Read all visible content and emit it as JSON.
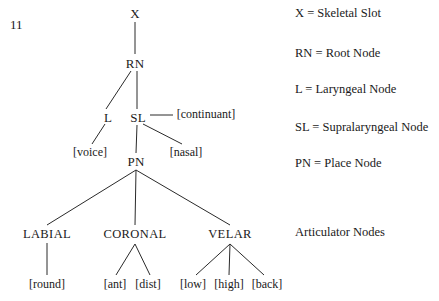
{
  "figure": {
    "number": "11",
    "title_hidden": "",
    "background_color": "#ffffff",
    "line_color": "#2a2a2a",
    "text_color": "#1a1a1a"
  },
  "tree": {
    "nodes": [
      {
        "id": "x",
        "label": "X",
        "x": 135,
        "y": 13
      },
      {
        "id": "rn",
        "label": "RN",
        "x": 135,
        "y": 63
      },
      {
        "id": "l",
        "label": "L",
        "x": 108,
        "y": 117
      },
      {
        "id": "sl",
        "label": "SL",
        "x": 138,
        "y": 117
      },
      {
        "id": "pn",
        "label": "PN",
        "x": 136,
        "y": 161
      },
      {
        "id": "labial",
        "label": "LABIAL",
        "x": 47,
        "y": 234
      },
      {
        "id": "coronal",
        "label": "CORONAL",
        "x": 135,
        "y": 234
      },
      {
        "id": "velar",
        "label": "VELAR",
        "x": 230,
        "y": 234
      }
    ],
    "features": [
      {
        "id": "continuant",
        "label": "[continuant]",
        "x": 206,
        "y": 114
      },
      {
        "id": "voice",
        "label": "[voice]",
        "x": 90,
        "y": 152
      },
      {
        "id": "nasal",
        "label": "[nasal]",
        "x": 186,
        "y": 152
      },
      {
        "id": "round",
        "label": "[round]",
        "x": 47,
        "y": 284
      },
      {
        "id": "ant",
        "label": "[ant]",
        "x": 115,
        "y": 284
      },
      {
        "id": "dist",
        "label": "[dist]",
        "x": 148,
        "y": 284
      },
      {
        "id": "low",
        "label": "[low]",
        "x": 193,
        "y": 284
      },
      {
        "id": "high",
        "label": "[high]",
        "x": 229,
        "y": 284
      },
      {
        "id": "back",
        "label": "[back]",
        "x": 267,
        "y": 284
      }
    ],
    "edges": [
      {
        "id": "x-rn",
        "from": "X",
        "to": "RN",
        "x1": 135,
        "y1": 22,
        "x2": 135,
        "y2": 54
      },
      {
        "id": "rn-l",
        "from": "RN",
        "to": "L",
        "x1": 131,
        "y1": 71,
        "x2": 106,
        "y2": 109
      },
      {
        "id": "rn-sl",
        "from": "RN",
        "to": "SL",
        "x1": 137,
        "y1": 71,
        "x2": 137,
        "y2": 109
      },
      {
        "id": "l-voice",
        "from": "L",
        "to": "[voice]",
        "x1": 105,
        "y1": 124,
        "x2": 92,
        "y2": 144
      },
      {
        "id": "sl-continuant",
        "from": "SL",
        "to": "[continuant]",
        "x1": 150,
        "y1": 115,
        "x2": 173,
        "y2": 115
      },
      {
        "id": "sl-pn",
        "from": "SL",
        "to": "PN",
        "x1": 137,
        "y1": 125,
        "x2": 136,
        "y2": 153
      },
      {
        "id": "sl-nasal",
        "from": "SL",
        "to": "[nasal]",
        "x1": 143,
        "y1": 124,
        "x2": 182,
        "y2": 144
      },
      {
        "id": "pn-labial",
        "from": "PN",
        "to": "LABIAL",
        "x1": 136,
        "y1": 170,
        "x2": 47,
        "y2": 225
      },
      {
        "id": "pn-coronal",
        "from": "PN",
        "to": "CORONAL",
        "x1": 136,
        "y1": 170,
        "x2": 135,
        "y2": 225
      },
      {
        "id": "pn-velar",
        "from": "PN",
        "to": "VELAR",
        "x1": 136,
        "y1": 170,
        "x2": 230,
        "y2": 225
      },
      {
        "id": "labial-round",
        "from": "LABIAL",
        "to": "[round]",
        "x1": 47,
        "y1": 243,
        "x2": 47,
        "y2": 275
      },
      {
        "id": "coronal-ant",
        "from": "CORONAL",
        "to": "[ant]",
        "x1": 135,
        "y1": 244,
        "x2": 116,
        "y2": 275
      },
      {
        "id": "coronal-dist",
        "from": "CORONAL",
        "to": "[dist]",
        "x1": 135,
        "y1": 244,
        "x2": 150,
        "y2": 275
      },
      {
        "id": "velar-low",
        "from": "VELAR",
        "to": "[low]",
        "x1": 230,
        "y1": 244,
        "x2": 196,
        "y2": 275
      },
      {
        "id": "velar-high",
        "from": "VELAR",
        "to": "[high]",
        "x1": 230,
        "y1": 244,
        "x2": 229,
        "y2": 275
      },
      {
        "id": "velar-back",
        "from": "VELAR",
        "to": "[back]",
        "x1": 230,
        "y1": 244,
        "x2": 264,
        "y2": 275
      }
    ]
  },
  "legend": {
    "items": [
      {
        "id": "legend-x",
        "text": "X = Skeletal Slot",
        "y": 13
      },
      {
        "id": "legend-rn",
        "text": "RN = Root Node",
        "y": 53
      },
      {
        "id": "legend-l",
        "text": "L = Laryngeal Node",
        "y": 89
      },
      {
        "id": "legend-sl",
        "text": "SL = Supralaryngeal Node",
        "y": 127
      },
      {
        "id": "legend-pn",
        "text": "PN = Place Node",
        "y": 163
      },
      {
        "id": "legend-an",
        "text": "Articulator Nodes",
        "y": 232
      }
    ]
  }
}
